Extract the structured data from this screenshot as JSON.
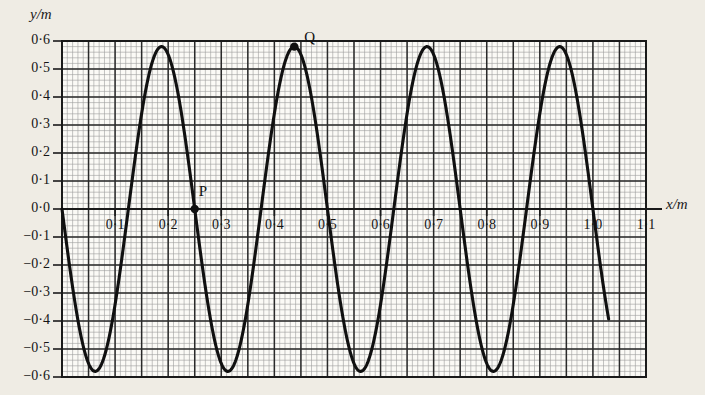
{
  "figure": {
    "y_axis_title": "y/m",
    "x_axis_title": "x/m"
  },
  "labels": {
    "point_p": "P",
    "point_q": "Q"
  },
  "colors": {
    "background": "#efece4",
    "curve": "#101010",
    "major_grid": "#2a2a2a",
    "minor_grid": "#8d8d8d",
    "border": "#1a1a1a",
    "text": "#141414"
  },
  "chart_data": {
    "type": "line",
    "title": "",
    "subtitle": "",
    "xlabel": "x/m",
    "ylabel": "y/m",
    "xlim": [
      0.0,
      1.1
    ],
    "ylim": [
      -0.6,
      0.6
    ],
    "grid": true,
    "legend": null,
    "x_ticks": [
      "0.1",
      "0.2",
      "0.3",
      "0.4",
      "0.5",
      "0.6",
      "0.7",
      "0.8",
      "0.9",
      "1.0",
      "1.1"
    ],
    "x_tick_values": [
      0.1,
      0.2,
      0.3,
      0.4,
      0.5,
      0.6,
      0.7,
      0.8,
      0.9,
      1.0,
      1.1
    ],
    "y_ticks": [
      "0.6",
      "0.5",
      "0.4",
      "0.3",
      "0.2",
      "0.1",
      "0.0",
      "-0.1",
      "-0.2",
      "-0.3",
      "-0.4",
      "-0.5",
      "-0.6"
    ],
    "y_tick_values": [
      0.6,
      0.5,
      0.4,
      0.3,
      0.2,
      0.1,
      0.0,
      -0.1,
      -0.2,
      -0.3,
      -0.4,
      -0.5,
      -0.6
    ],
    "minor_grid_x_step": 0.01,
    "minor_grid_y_step": 0.02,
    "major_grid_x_step": 0.05,
    "major_grid_y_step": 0.1,
    "series": [
      {
        "name": "transverse wave",
        "waveform": "sine",
        "amplitude": 0.58,
        "wavelength": 0.25,
        "phase": "negative sine (starts at origin moving downward)",
        "x_start": 0.0,
        "x_end": 1.03,
        "y_end": -0.4,
        "crests_x": [
          0.1875,
          0.4375,
          0.6875,
          0.9375
        ],
        "crests_y": 0.58,
        "troughs_x": [
          0.0625,
          0.3125,
          0.5625,
          0.8125
        ],
        "troughs_y": -0.58,
        "zero_crossings_x": [
          0.0,
          0.125,
          0.25,
          0.375,
          0.5,
          0.625,
          0.75,
          0.875,
          1.0
        ]
      }
    ],
    "annotations": [
      {
        "label": "P",
        "x": 0.25,
        "y": 0.0,
        "marker": "filled-circle",
        "label_offset": "above-right"
      },
      {
        "label": "Q",
        "x": 0.4375,
        "y": 0.58,
        "marker": "filled-circle",
        "label_offset": "right"
      }
    ]
  }
}
